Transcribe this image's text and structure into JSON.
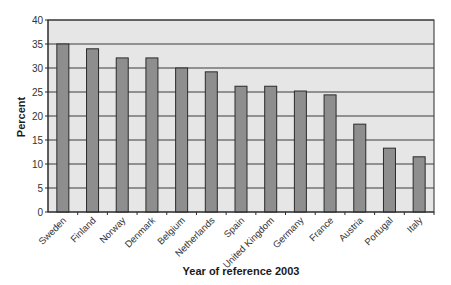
{
  "chart_data": {
    "type": "bar",
    "title": "",
    "xlabel": "Year of reference 2003",
    "ylabel": "Percent",
    "ylim": [
      0,
      40
    ],
    "yticks": [
      0,
      5,
      10,
      15,
      20,
      25,
      30,
      35,
      40
    ],
    "grid": true,
    "legend": null,
    "categories": [
      "Sweden",
      "Finland",
      "Norway",
      "Denmark",
      "Belgium",
      "Netherlands",
      "Spain",
      "United Kingdom",
      "Germany",
      "France",
      "Austria",
      "Portugal",
      "Italy"
    ],
    "values": [
      35.0,
      34.0,
      32.1,
      32.1,
      30.0,
      29.2,
      26.2,
      26.2,
      25.2,
      24.4,
      18.3,
      13.3,
      11.5
    ]
  },
  "colors": {
    "bar_fill": "#8e8e8e",
    "bar_stroke": "#2b2b2b",
    "plot_bg": "#e6e6e6",
    "grid": "#3a3a3a"
  }
}
